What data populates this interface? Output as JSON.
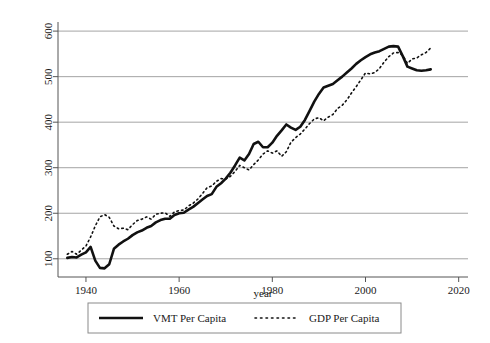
{
  "chart_data": {
    "type": "line",
    "title": "",
    "subtitle": "",
    "xlabel": "year",
    "ylabel": "",
    "xlim": [
      1934,
      2022
    ],
    "ylim": [
      60,
      620
    ],
    "grid": "horizontal",
    "legend_position": "bottom",
    "xticks": [
      "1940",
      "1960",
      "1980",
      "2000",
      "2020"
    ],
    "xtick_values": [
      1940,
      1960,
      1980,
      2000,
      2020
    ],
    "yticks": [
      "100",
      "200",
      "300",
      "400",
      "500",
      "600"
    ],
    "ytick_values": [
      100,
      200,
      300,
      400,
      500,
      600
    ],
    "x": [
      1936,
      1937,
      1938,
      1939,
      1940,
      1941,
      1942,
      1943,
      1944,
      1945,
      1946,
      1947,
      1948,
      1949,
      1950,
      1951,
      1952,
      1953,
      1954,
      1955,
      1956,
      1957,
      1958,
      1959,
      1960,
      1961,
      1962,
      1963,
      1964,
      1965,
      1966,
      1967,
      1968,
      1969,
      1970,
      1971,
      1972,
      1973,
      1974,
      1975,
      1976,
      1977,
      1978,
      1979,
      1980,
      1981,
      1982,
      1983,
      1984,
      1985,
      1986,
      1987,
      1988,
      1989,
      1990,
      1991,
      1992,
      1993,
      1994,
      1995,
      1996,
      1997,
      1998,
      1999,
      2000,
      2001,
      2002,
      2003,
      2004,
      2005,
      2006,
      2007,
      2008,
      2009,
      2010,
      2011,
      2012,
      2013,
      2014
    ],
    "series": [
      {
        "name": "VMT Per Capita",
        "style": "solid",
        "color": "#111111",
        "width": 2.6,
        "values": [
          102,
          104,
          103,
          109,
          114,
          126,
          96,
          80,
          79,
          88,
          122,
          131,
          138,
          144,
          152,
          158,
          162,
          168,
          172,
          180,
          185,
          188,
          188,
          196,
          200,
          201,
          208,
          214,
          222,
          230,
          238,
          242,
          258,
          266,
          276,
          289,
          305,
          322,
          316,
          330,
          352,
          357,
          345,
          345,
          355,
          370,
          382,
          395,
          388,
          383,
          390,
          405,
          425,
          445,
          462,
          476,
          480,
          484,
          492,
          500,
          509,
          518,
          528,
          536,
          543,
          549,
          553,
          556,
          561,
          566,
          567,
          566,
          545,
          522,
          518,
          514,
          513,
          514,
          516
        ]
      },
      {
        "name": "GDP Per Capita",
        "style": "dotted",
        "color": "#111111",
        "width": 1.6,
        "values": [
          110,
          116,
          110,
          119,
          128,
          148,
          172,
          192,
          197,
          191,
          172,
          166,
          167,
          164,
          175,
          184,
          187,
          192,
          187,
          198,
          200,
          201,
          193,
          203,
          206,
          207,
          216,
          222,
          231,
          243,
          256,
          260,
          270,
          276,
          275,
          281,
          292,
          305,
          300,
          295,
          307,
          317,
          330,
          337,
          332,
          337,
          325,
          335,
          356,
          366,
          374,
          385,
          397,
          407,
          410,
          403,
          411,
          417,
          430,
          437,
          449,
          464,
          478,
          493,
          508,
          506,
          509,
          518,
          532,
          544,
          552,
          553,
          547,
          529,
          539,
          541,
          548,
          553,
          563
        ]
      }
    ]
  },
  "legend": {
    "entries": [
      {
        "label": "VMT Per Capita",
        "style": "solid"
      },
      {
        "label": "GDP Per Capita",
        "style": "dotted"
      }
    ]
  },
  "axis": {
    "x_title": "year"
  },
  "colors": {
    "line": "#111111",
    "grid": "#9a9a9a",
    "axis": "#555555",
    "legend_border": "#8a8a8a",
    "background": "#ffffff"
  }
}
